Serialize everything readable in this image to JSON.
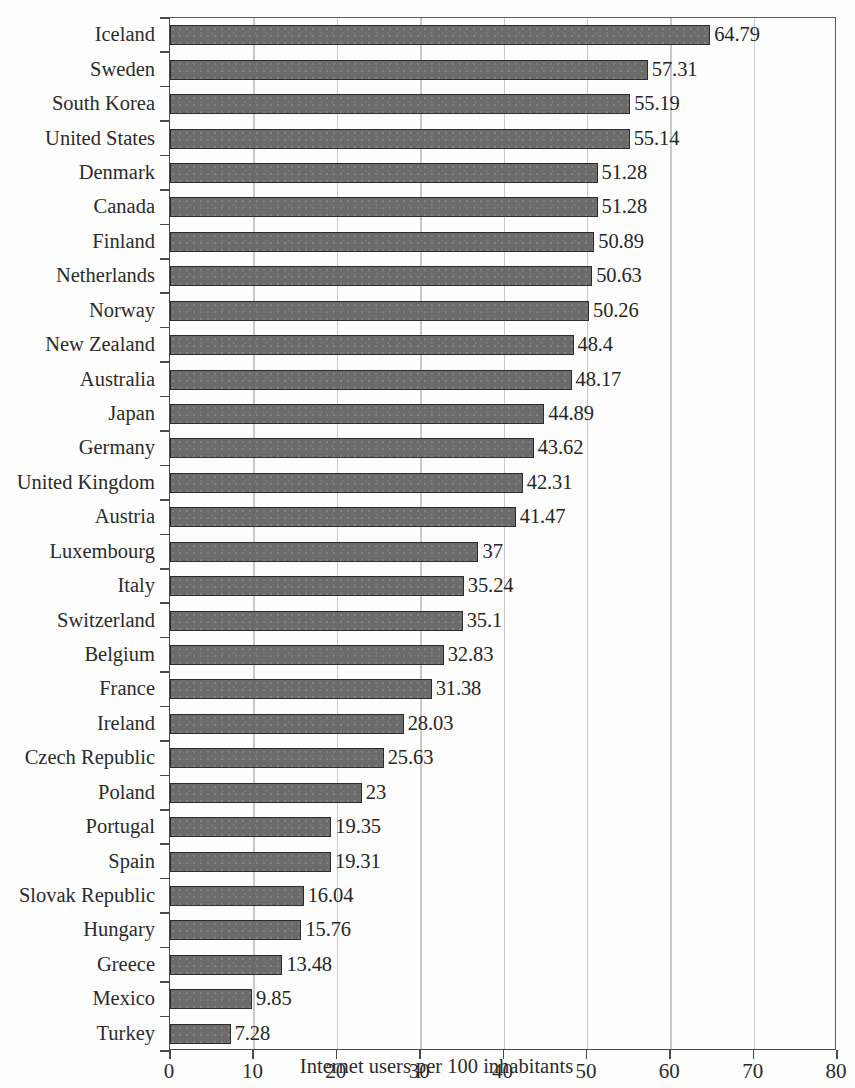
{
  "chart_data": {
    "type": "bar",
    "orientation": "horizontal",
    "title": "",
    "xlabel": "Internet users per 100 inhabitants",
    "ylabel": "",
    "xlim": [
      0,
      80
    ],
    "xticks": [
      0,
      10,
      20,
      30,
      40,
      50,
      60,
      70,
      80
    ],
    "grid": true,
    "legend": "none",
    "bar_color": "#6b6b6b",
    "bar_border_color": "#2b2b2b",
    "gridline_color": "#c9c9c9",
    "axis_color": "#4a4a4a",
    "background_color": "#fdfdfd",
    "categories": [
      "Iceland",
      "Sweden",
      "South Korea",
      "United States",
      "Denmark",
      "Canada",
      "Finland",
      "Netherlands",
      "Norway",
      "New Zealand",
      "Australia",
      "Japan",
      "Germany",
      "United Kingdom",
      "Austria",
      "Luxembourg",
      "Italy",
      "Switzerland",
      "Belgium",
      "France",
      "Ireland",
      "Czech Republic",
      "Poland",
      "Portugal",
      "Spain",
      "Slovak Republic",
      "Hungary",
      "Greece",
      "Mexico",
      "Turkey"
    ],
    "values": [
      64.79,
      57.31,
      55.19,
      55.14,
      51.28,
      51.28,
      50.89,
      50.63,
      50.26,
      48.4,
      48.17,
      44.89,
      43.62,
      42.31,
      41.47,
      37,
      35.24,
      35.1,
      32.83,
      31.38,
      28.03,
      25.63,
      23,
      19.35,
      19.31,
      16.04,
      15.76,
      13.48,
      9.85,
      7.28
    ],
    "value_labels": [
      "64.79",
      "57.31",
      "55.19",
      "55.14",
      "51.28",
      "51.28",
      "50.89",
      "50.63",
      "50.26",
      "48.4",
      "48.17",
      "44.89",
      "43.62",
      "42.31",
      "41.47",
      "37",
      "35.24",
      "35.1",
      "32.83",
      "31.38",
      "28.03",
      "25.63",
      "23",
      "19.35",
      "19.31",
      "16.04",
      "15.76",
      "13.48",
      "9.85",
      "7.28"
    ]
  }
}
